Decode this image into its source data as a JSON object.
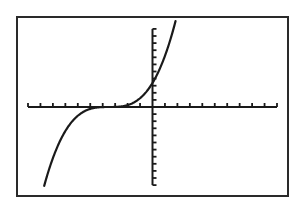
{
  "chart_data": {
    "type": "line",
    "title": "",
    "xlabel": "",
    "ylabel": "",
    "function": {
      "form": "a*(x-h)^3",
      "a": 0.079,
      "h": -3.5,
      "k": 0
    },
    "xlim": [
      -10,
      10
    ],
    "ylim": [
      -11,
      11
    ],
    "x_tick_spacing": 1,
    "y_tick_spacing": 1,
    "grid": false,
    "legend": null,
    "x": [
      -10,
      -9,
      -8,
      -7,
      -6,
      -5,
      -4,
      -3.5,
      -3,
      -2,
      -1,
      0,
      1,
      2
    ],
    "y": [
      -21.7,
      -13.1,
      -7.2,
      -3.4,
      -1.23,
      -0.27,
      -0.01,
      0,
      0.01,
      0.27,
      1.23,
      3.39,
      7.2,
      13.1
    ],
    "y_intercept": 3.4,
    "inflection_point": [
      -3.5,
      0
    ]
  },
  "colors": {
    "background": "#ffffff",
    "frame": "#2a2a2a",
    "axes": "#1a1a1a",
    "curve": "#1a1a1a"
  },
  "labels": {
    "window": "Graph screen"
  }
}
